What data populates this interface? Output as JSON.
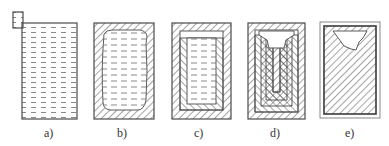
{
  "figure": {
    "stroke_color": "#4a4a4a",
    "background": "#ffffff",
    "panels": [
      {
        "id": "a",
        "label": "a)",
        "description": "Ingot mould full of liquid metal with feeder on top-left"
      },
      {
        "id": "b",
        "label": "b)",
        "description": "Solidified shell forming around liquid core"
      },
      {
        "id": "c",
        "label": "c)",
        "description": "Thicker solid layers, liquid level dropping"
      },
      {
        "id": "d",
        "label": "d)",
        "description": "Successive solid layers with shrinkage funnel"
      },
      {
        "id": "e",
        "label": "e)",
        "description": "Fully solidified ingot with shrinkage cavity at top"
      }
    ]
  }
}
